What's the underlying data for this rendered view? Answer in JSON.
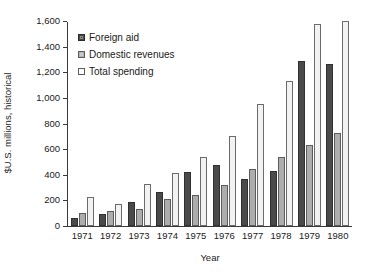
{
  "chart_data": {
    "type": "bar",
    "title": "",
    "xlabel": "Year",
    "ylabel": "$U.S. millions, historical",
    "categories": [
      "1971",
      "1972",
      "1973",
      "1974",
      "1975",
      "1976",
      "1977",
      "1978",
      "1979",
      "1980"
    ],
    "ylim": [
      0,
      1600
    ],
    "yticks": [
      0,
      200,
      400,
      600,
      800,
      1000,
      1200,
      1400,
      1600
    ],
    "ytick_labels": [
      "0",
      "200",
      "400",
      "600",
      "800",
      "1,000",
      "1,200",
      "1,400",
      "1,600"
    ],
    "grid": false,
    "legend_position": "upper-left-inside",
    "series": [
      {
        "name": "Foreign aid",
        "color": "#4a4a4a",
        "values": [
          60,
          95,
          185,
          265,
          420,
          480,
          370,
          430,
          1290,
          1265
        ]
      },
      {
        "name": "Domestic revenues",
        "color": "#adadad",
        "values": [
          100,
          120,
          135,
          210,
          240,
          320,
          445,
          535,
          630,
          725
        ]
      },
      {
        "name": "Total spending",
        "color": "#f2f2f2",
        "values": [
          225,
          175,
          330,
          415,
          540,
          705,
          950,
          1135,
          1575,
          1600
        ]
      }
    ]
  },
  "axis": {
    "y_title": "$U.S. millions, historical",
    "x_title": "Year"
  },
  "legend": {
    "items": [
      {
        "label": "Foreign aid"
      },
      {
        "label": "Domestic revenues"
      },
      {
        "label": "Total spending"
      }
    ]
  },
  "colors": {
    "foreign_aid": "#4a4a4a",
    "domestic_revenues": "#adadad",
    "total_spending": "#f2f2f2",
    "axis": "#3a3a3a",
    "background": "#ffffff"
  }
}
